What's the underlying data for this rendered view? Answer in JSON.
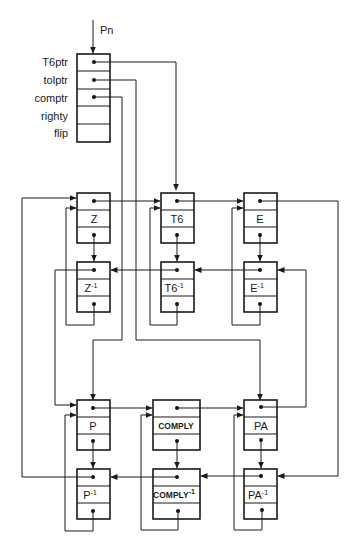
{
  "entry_pointer": {
    "label": "Pn"
  },
  "root_record": {
    "fields": [
      {
        "label": "T6ptr",
        "has_pointer": true
      },
      {
        "label": "tolptr",
        "has_pointer": true
      },
      {
        "label": "comptr",
        "has_pointer": true
      },
      {
        "label": "righty",
        "has_pointer": false
      },
      {
        "label": "flip",
        "has_pointer": false
      }
    ]
  },
  "nodes": {
    "Z": {
      "label": "Z"
    },
    "Z_inv": {
      "label": "Z",
      "sup": "-1"
    },
    "T6": {
      "label": "T6"
    },
    "T6_inv": {
      "label": "T6",
      "sup": "-1"
    },
    "E": {
      "label": "E"
    },
    "E_inv": {
      "label": "E",
      "sup": "-1"
    },
    "P": {
      "label": "P"
    },
    "P_inv": {
      "label": "P",
      "sup": "-1"
    },
    "COMPLY": {
      "label": "COMPLY"
    },
    "COMPLY_inv": {
      "label": "COMPLY",
      "sup": "-1"
    },
    "PA": {
      "label": "PA"
    },
    "PA_inv": {
      "label": "PA",
      "sup": "-1"
    }
  },
  "colors": {
    "ink": "#1a1a1a",
    "background": "#ffffff"
  }
}
